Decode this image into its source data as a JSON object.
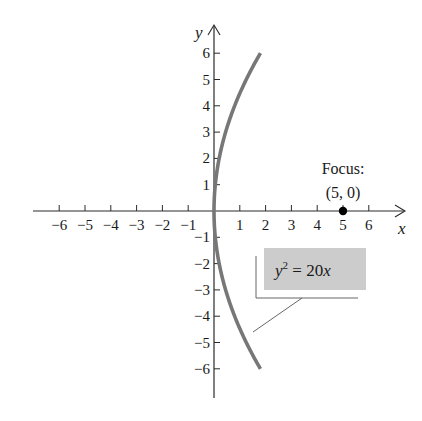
{
  "chart_data": {
    "type": "line",
    "title": "",
    "xlabel": "x",
    "ylabel": "y",
    "xlim": [
      -6.9,
      7.4
    ],
    "ylim": [
      -7.0,
      7.0
    ],
    "grid": false,
    "x_ticks": [
      -6,
      -5,
      -4,
      -3,
      -2,
      -1,
      1,
      2,
      3,
      4,
      5,
      6
    ],
    "y_ticks": [
      -6,
      -5,
      -4,
      -3,
      -2,
      -1,
      1,
      2,
      3,
      4,
      5,
      6
    ],
    "x_tick_labels": [
      "−6",
      "−5",
      "−4",
      "−3",
      "−2",
      "−1",
      "1",
      "2",
      "3",
      "4",
      "5",
      "6"
    ],
    "y_tick_labels": [
      "−6",
      "−5",
      "−4",
      "−3",
      "−2",
      "−1",
      "1",
      "2",
      "3",
      "4",
      "5",
      "6"
    ],
    "series": [
      {
        "name": "y^2 = 20x",
        "equation": "y² = 20x",
        "color": "#777777",
        "y_range": [
          -6,
          6
        ],
        "points": [
          {
            "x": 1.8,
            "y": -6
          },
          {
            "x": 1.25,
            "y": -5
          },
          {
            "x": 0.8,
            "y": -4
          },
          {
            "x": 0.45,
            "y": -3
          },
          {
            "x": 0.2,
            "y": -2
          },
          {
            "x": 0.05,
            "y": -1
          },
          {
            "x": 0,
            "y": 0
          },
          {
            "x": 0.05,
            "y": 1
          },
          {
            "x": 0.2,
            "y": 2
          },
          {
            "x": 0.45,
            "y": 3
          },
          {
            "x": 0.8,
            "y": 4
          },
          {
            "x": 1.25,
            "y": 5
          },
          {
            "x": 1.8,
            "y": 6
          }
        ]
      }
    ],
    "annotations": [
      {
        "type": "point",
        "x": 5,
        "y": 0,
        "label_line1": "Focus:",
        "label_line2": "(5, 0)"
      },
      {
        "type": "callout",
        "text": "y² = 20x",
        "target": "parabola"
      }
    ]
  },
  "labels": {
    "x_axis": "x",
    "y_axis": "y",
    "focus_title": "Focus:",
    "focus_coords": "(5, 0)",
    "eq_y": "y",
    "eq_exp": "2",
    "eq_rest": " = 20x"
  },
  "colors": {
    "axis": "#2a2a2a",
    "curve": "#7a7a7a",
    "callout_fill": "#cccccc",
    "callout_line": "#555555",
    "focus_point": "#000000"
  }
}
